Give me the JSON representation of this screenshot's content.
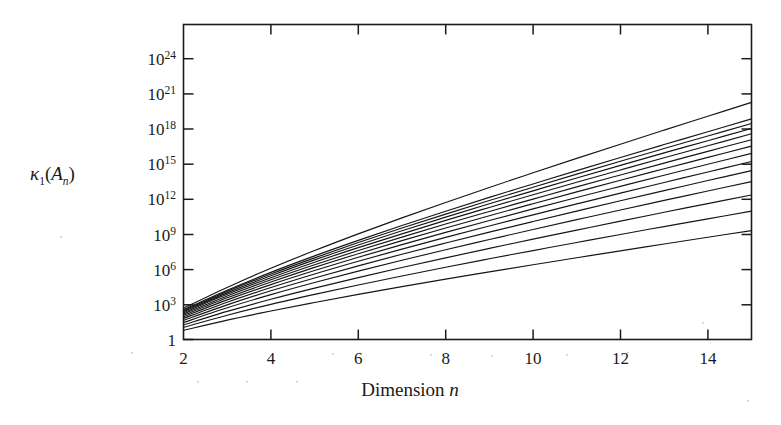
{
  "chart_data": {
    "type": "line",
    "title": "",
    "xlabel": "Dimension n",
    "ylabel": "κ₁(Aₙ)",
    "xlabel_parts": {
      "word": "Dimension",
      "symbol": "n"
    },
    "ylabel_parts": {
      "base": "κ",
      "base_sub": "1",
      "open": "(",
      "arg": "A",
      "arg_sub": "n",
      "close": ")"
    },
    "xscale": "linear",
    "yscale": "log",
    "xlim": [
      2,
      15
    ],
    "ylim": [
      1,
      1e+26
    ],
    "grid": false,
    "legend": null,
    "x_ticks": [
      2,
      4,
      6,
      8,
      10,
      12,
      14
    ],
    "x_tick_labels": [
      "2",
      "4",
      "6",
      "8",
      "10",
      "12",
      "14"
    ],
    "y_ticks": [
      1,
      1000,
      1000000.0,
      1000000000.0,
      1000000000000.0,
      1000000000000000.0,
      1e+18,
      1e+21,
      1e+24
    ],
    "y_tick_labels": [
      "1",
      "10³",
      "10⁶",
      "10⁹",
      "10¹²",
      "10¹⁵",
      "10¹⁸",
      "10²¹",
      "10²⁴"
    ],
    "y_tick_exponents": [
      "",
      "3",
      "6",
      "9",
      "12",
      "15",
      "18",
      "21",
      "24"
    ],
    "y_tick_mantissa": "10",
    "series_count": 14,
    "x": [
      2,
      3,
      4,
      5,
      6,
      7,
      8,
      9,
      10,
      11,
      12,
      13,
      14,
      15
    ],
    "series": [
      {
        "name": "curve-1",
        "log10_values": [
          0.75,
          1.6,
          2.35,
          3.05,
          3.72,
          4.36,
          4.98,
          5.58,
          6.17,
          6.75,
          7.32,
          7.88,
          8.44,
          8.99
        ]
      },
      {
        "name": "curve-2",
        "log10_values": [
          1.0,
          2.0,
          2.9,
          3.72,
          4.5,
          5.24,
          5.96,
          6.66,
          7.34,
          8.01,
          8.67,
          9.32,
          9.96,
          10.6
        ]
      },
      {
        "name": "curve-3",
        "log10_values": [
          1.2,
          2.32,
          3.32,
          4.24,
          5.11,
          5.94,
          6.74,
          7.52,
          8.28,
          9.03,
          9.77,
          10.5,
          11.22,
          11.93
        ]
      },
      {
        "name": "curve-4",
        "log10_values": [
          1.4,
          2.62,
          3.7,
          4.7,
          5.64,
          6.54,
          7.41,
          8.25,
          9.08,
          9.89,
          10.69,
          11.48,
          12.26,
          13.03
        ]
      },
      {
        "name": "curve-5",
        "log10_values": [
          1.58,
          2.86,
          4.02,
          5.08,
          6.08,
          7.04,
          7.96,
          8.86,
          9.74,
          10.6,
          11.45,
          12.29,
          13.12,
          13.94
        ]
      },
      {
        "name": "curve-6",
        "log10_values": [
          1.74,
          3.08,
          4.29,
          5.41,
          6.46,
          7.46,
          8.43,
          9.37,
          10.29,
          11.19,
          12.08,
          12.96,
          13.83,
          14.69
        ]
      },
      {
        "name": "curve-7",
        "log10_values": [
          1.88,
          3.27,
          4.53,
          5.69,
          6.79,
          7.83,
          8.84,
          9.82,
          10.78,
          11.72,
          12.64,
          13.56,
          14.46,
          15.36
        ]
      },
      {
        "name": "curve-8",
        "log10_values": [
          2.0,
          3.44,
          4.74,
          5.95,
          7.08,
          8.16,
          9.2,
          10.22,
          11.21,
          12.18,
          13.14,
          14.09,
          15.03,
          15.96
        ]
      },
      {
        "name": "curve-9",
        "log10_values": [
          2.11,
          3.59,
          4.93,
          6.17,
          7.34,
          8.45,
          9.53,
          10.57,
          11.59,
          12.6,
          13.58,
          14.56,
          15.53,
          16.49
        ]
      },
      {
        "name": "curve-10",
        "log10_values": [
          2.21,
          3.73,
          5.1,
          6.38,
          7.58,
          8.72,
          9.83,
          10.9,
          11.95,
          12.98,
          13.99,
          15.0,
          15.99,
          16.98
        ]
      },
      {
        "name": "curve-11",
        "log10_values": [
          2.3,
          3.85,
          5.26,
          6.57,
          7.8,
          8.97,
          10.1,
          11.2,
          12.27,
          13.33,
          14.37,
          15.4,
          16.41,
          17.42
        ]
      },
      {
        "name": "curve-12",
        "log10_values": [
          2.38,
          3.97,
          5.41,
          6.74,
          8.0,
          9.2,
          10.35,
          11.47,
          12.57,
          13.65,
          14.71,
          15.76,
          16.8,
          17.83
        ]
      },
      {
        "name": "curve-13",
        "log10_values": [
          2.46,
          4.07,
          5.54,
          6.9,
          8.18,
          9.41,
          10.59,
          11.73,
          12.84,
          13.94,
          15.02,
          16.09,
          17.15,
          18.21
        ]
      },
      {
        "name": "curve-14",
        "log10_values": [
          2.6,
          4.3,
          5.88,
          7.34,
          8.72,
          10.04,
          11.31,
          12.55,
          13.76,
          14.95,
          16.12,
          17.28,
          18.43,
          19.57
        ]
      }
    ]
  }
}
